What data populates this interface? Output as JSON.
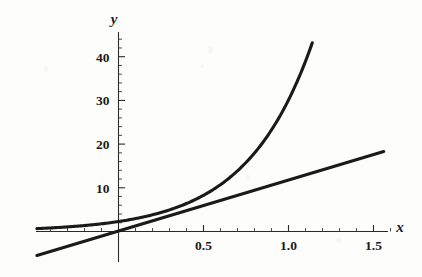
{
  "figure": {
    "background_color": "#fdfdfc",
    "ink_color": "#1a1a1a",
    "axis_color": "#2a2a2a"
  },
  "chart_data": {
    "type": "line",
    "title": "",
    "subtitle": "",
    "xlabel": "x",
    "ylabel": "y",
    "grid": false,
    "legend": "none",
    "xlim": [
      -0.48,
      1.66
    ],
    "ylim": [
      -6,
      46
    ],
    "x_ticks_major": [
      0.5,
      1.0,
      1.5
    ],
    "x_tick_labels": [
      "0.5",
      "1.0",
      "1.5"
    ],
    "x_ticks_minor": [
      -0.4,
      -0.3,
      -0.2,
      -0.1,
      0.1,
      0.2,
      0.3,
      0.4,
      0.6,
      0.7,
      0.8,
      0.9,
      1.1,
      1.2,
      1.3,
      1.4,
      1.6
    ],
    "y_ticks_major": [
      10,
      20,
      30,
      40
    ],
    "y_tick_labels": [
      "10",
      "20",
      "30",
      "40"
    ],
    "y_ticks_minor": [
      2,
      4,
      6,
      8,
      12,
      14,
      16,
      18,
      22,
      24,
      26,
      28,
      32,
      34,
      36,
      38,
      42,
      44
    ],
    "axes_origin": [
      0,
      0
    ],
    "series": [
      {
        "name": "exponential-curve",
        "kind": "curve",
        "x": [
          -0.48,
          -0.4,
          -0.3,
          -0.2,
          -0.1,
          0.0,
          0.1,
          0.2,
          0.3,
          0.4,
          0.5,
          0.6,
          0.7,
          0.8,
          0.9,
          1.0,
          1.1,
          1.2,
          1.3,
          1.4,
          1.5,
          1.56
        ],
        "y": [
          0.66,
          0.81,
          1.05,
          1.36,
          1.76,
          2.28,
          2.95,
          3.82,
          4.94,
          6.4,
          8.28,
          10.72,
          13.87,
          17.96,
          23.25,
          30.09,
          38.95,
          44.4,
          44.4,
          44.4,
          44.4,
          44.4
        ]
      },
      {
        "name": "straight-line",
        "kind": "line",
        "x": [
          -0.48,
          1.56
        ],
        "y": [
          -5.5,
          18.3
        ]
      }
    ]
  },
  "labels": {
    "y_axis": "y",
    "x_axis": "x"
  }
}
